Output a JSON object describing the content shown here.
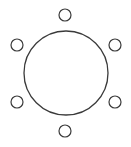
{
  "diagram": {
    "canvas": {
      "width": 131,
      "height": 147,
      "background": "#ffffff"
    },
    "stroke_color": "#3a3a3a",
    "table": {
      "shape": "circle",
      "cx": 66,
      "cy": 73,
      "r": 42,
      "stroke_width": 1.3
    },
    "seats": [
      {
        "id": "seat-top",
        "cx": 65,
        "cy": 15,
        "r": 6
      },
      {
        "id": "seat-upper-right",
        "cx": 115,
        "cy": 45,
        "r": 6
      },
      {
        "id": "seat-lower-right",
        "cx": 115,
        "cy": 102,
        "r": 6
      },
      {
        "id": "seat-bottom",
        "cx": 65,
        "cy": 131,
        "r": 6
      },
      {
        "id": "seat-lower-left",
        "cx": 17,
        "cy": 102,
        "r": 6
      },
      {
        "id": "seat-upper-left",
        "cx": 17,
        "cy": 45,
        "r": 6
      }
    ],
    "seat_count": 6
  }
}
